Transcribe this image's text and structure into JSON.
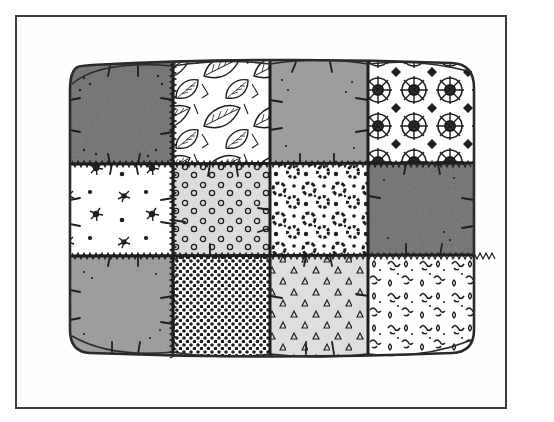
{
  "illustration": {
    "subject": "Puff quilt",
    "grid": {
      "columns": 4,
      "rows": 3
    },
    "colors": {
      "frame": "#3a3a3a",
      "outline": "#2a2a2a",
      "dark_gray": "#6e6e6e",
      "mid_gray": "#9a9a9a",
      "light_gray": "#d8d8d8",
      "white": "#ffffff",
      "ink": "#1e1e1e"
    },
    "squares": [
      {
        "row": 1,
        "col": 1,
        "pattern": "solid-dark"
      },
      {
        "row": 1,
        "col": 2,
        "pattern": "leaf-print"
      },
      {
        "row": 1,
        "col": 3,
        "pattern": "solid-mid"
      },
      {
        "row": 1,
        "col": 4,
        "pattern": "medallion-lace"
      },
      {
        "row": 2,
        "col": 1,
        "pattern": "scattered-splatter"
      },
      {
        "row": 2,
        "col": 2,
        "pattern": "ring-dots"
      },
      {
        "row": 2,
        "col": 3,
        "pattern": "bubbly-blobs"
      },
      {
        "row": 2,
        "col": 4,
        "pattern": "solid-dark"
      },
      {
        "row": 3,
        "col": 1,
        "pattern": "solid-mid"
      },
      {
        "row": 3,
        "col": 2,
        "pattern": "dense-dots"
      },
      {
        "row": 3,
        "col": 3,
        "pattern": "triangles"
      },
      {
        "row": 3,
        "col": 4,
        "pattern": "squiggle-print"
      }
    ]
  }
}
